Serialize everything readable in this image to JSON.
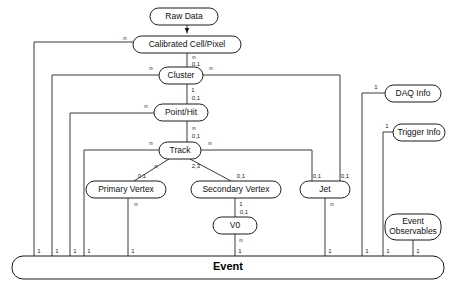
{
  "diagram": {
    "type": "entity-relationship-diagram",
    "colors": {
      "background": "#ffffff",
      "node_stroke": "#1a1a1a",
      "node_fill": "#ffffff",
      "edge_stroke": "#3a3a3a",
      "text": "#111111"
    },
    "nodes": [
      {
        "id": "raw_data",
        "label": "Raw Data",
        "x": 150,
        "y": 8,
        "w": 68,
        "h": 17,
        "lines": [
          "Raw Data"
        ]
      },
      {
        "id": "calibrated_cell",
        "label": "Calibrated Cell/Pixel",
        "x": 133,
        "y": 36,
        "w": 108,
        "h": 17,
        "lines": [
          "Calibrated Cell/Pixel"
        ]
      },
      {
        "id": "cluster",
        "label": "Cluster",
        "x": 159,
        "y": 67,
        "w": 44,
        "h": 17,
        "lines": [
          "Cluster"
        ]
      },
      {
        "id": "point_hit",
        "label": "Point/Hit",
        "x": 154,
        "y": 104,
        "w": 54,
        "h": 17,
        "lines": [
          "Point/Hit"
        ]
      },
      {
        "id": "track",
        "label": "Track",
        "x": 159,
        "y": 142,
        "w": 42,
        "h": 17,
        "lines": [
          "Track"
        ]
      },
      {
        "id": "primary_vertex",
        "label": "Primary Vertex",
        "x": 86,
        "y": 181,
        "w": 80,
        "h": 17,
        "lines": [
          "Primary Vertex"
        ]
      },
      {
        "id": "secondary_vertex",
        "label": "Secondary Vertex",
        "x": 191,
        "y": 181,
        "w": 90,
        "h": 17,
        "lines": [
          "Secondary Vertex"
        ]
      },
      {
        "id": "jet",
        "label": "Jet",
        "x": 300,
        "y": 181,
        "w": 50,
        "h": 17,
        "lines": [
          "Jet"
        ]
      },
      {
        "id": "v0",
        "label": "V0",
        "x": 213,
        "y": 217,
        "w": 44,
        "h": 17,
        "lines": [
          "V0"
        ]
      },
      {
        "id": "daq_info",
        "label": "DAQ Info",
        "x": 385,
        "y": 85,
        "w": 56,
        "h": 17,
        "lines": [
          "DAQ Info"
        ]
      },
      {
        "id": "trigger_info",
        "label": "Trigger Info",
        "x": 393,
        "y": 124,
        "w": 52,
        "h": 17,
        "lines": [
          "Trigger Info"
        ]
      },
      {
        "id": "event_observables",
        "label": "Event Observables",
        "x": 385,
        "y": 214,
        "w": 56,
        "h": 26,
        "lines": [
          "Event",
          "Observables"
        ]
      },
      {
        "id": "event",
        "label": "Event",
        "x": 12,
        "y": 256,
        "w": 432,
        "h": 23,
        "lines": [
          "Event"
        ]
      }
    ],
    "cardinalities": [
      {
        "id": "card-cal-n",
        "text": "n",
        "x": 125,
        "y": 38
      },
      {
        "id": "card-cal-down-n",
        "text": "n",
        "x": 194,
        "y": 57
      },
      {
        "id": "card-cluster-01",
        "text": "0,1",
        "x": 196,
        "y": 64
      },
      {
        "id": "card-cluster-left-n",
        "text": "n",
        "x": 151,
        "y": 68
      },
      {
        "id": "card-cluster-right-n",
        "text": "n",
        "x": 211,
        "y": 68
      },
      {
        "id": "card-cluster-down-1",
        "text": "1",
        "x": 193,
        "y": 90
      },
      {
        "id": "card-point-01",
        "text": "0,1",
        "x": 196,
        "y": 98
      },
      {
        "id": "card-point-left-n",
        "text": "n",
        "x": 146,
        "y": 106
      },
      {
        "id": "card-point-down-n",
        "text": "n",
        "x": 194,
        "y": 128
      },
      {
        "id": "card-track-01",
        "text": "0,1",
        "x": 196,
        "y": 136
      },
      {
        "id": "card-track-left-n",
        "text": "n",
        "x": 151,
        "y": 143
      },
      {
        "id": "card-track-right-n",
        "text": "n",
        "x": 210,
        "y": 143
      },
      {
        "id": "card-pv-n",
        "text": "n",
        "x": 156,
        "y": 166
      },
      {
        "id": "card-pv-01",
        "text": "0,1",
        "x": 142,
        "y": 176
      },
      {
        "id": "card-sv-23",
        "text": "2,3",
        "x": 196,
        "y": 166
      },
      {
        "id": "card-sv-01",
        "text": "0,1",
        "x": 241,
        "y": 176
      },
      {
        "id": "card-jet-01a",
        "text": "0,1",
        "x": 317,
        "y": 176
      },
      {
        "id": "card-jet-01b",
        "text": "0,1",
        "x": 345,
        "y": 176
      },
      {
        "id": "card-pv-down-n",
        "text": "n",
        "x": 136,
        "y": 204
      },
      {
        "id": "card-sv-down-1",
        "text": "1",
        "x": 241,
        "y": 204
      },
      {
        "id": "card-v0-01",
        "text": "0,1",
        "x": 244,
        "y": 212
      },
      {
        "id": "card-v0-down-n",
        "text": "n",
        "x": 241,
        "y": 240
      },
      {
        "id": "card-jet-down-n",
        "text": "n",
        "x": 332,
        "y": 204
      },
      {
        "id": "card-daq-1",
        "text": "1",
        "x": 376,
        "y": 87
      },
      {
        "id": "card-trigger-1",
        "text": "1",
        "x": 387,
        "y": 126
      },
      {
        "id": "card-ev-1a",
        "text": "1",
        "x": 39,
        "y": 251
      },
      {
        "id": "card-ev-1b",
        "text": "1",
        "x": 57,
        "y": 251
      },
      {
        "id": "card-ev-1c",
        "text": "1",
        "x": 75,
        "y": 251
      },
      {
        "id": "card-ev-1d",
        "text": "1",
        "x": 89,
        "y": 251
      },
      {
        "id": "card-ev-1e",
        "text": "1",
        "x": 133,
        "y": 251
      },
      {
        "id": "card-ev-1f",
        "text": "1",
        "x": 240,
        "y": 251
      },
      {
        "id": "card-ev-1g",
        "text": "1",
        "x": 330,
        "y": 251
      },
      {
        "id": "card-ev-1h",
        "text": "1",
        "x": 367,
        "y": 251
      },
      {
        "id": "card-ev-1i",
        "text": "1",
        "x": 388,
        "y": 251
      },
      {
        "id": "card-ev-1j",
        "text": "1",
        "x": 418,
        "y": 251
      }
    ],
    "edges": [
      {
        "id": "edge-raw-to-cal",
        "from": "raw_data",
        "to": "calibrated_cell",
        "path": "M 187 25 L 187 33"
      },
      {
        "id": "edge-cal-to-cluster",
        "from": "calibrated_cell",
        "to": "cluster",
        "path": "M 187 53 L 187 67"
      },
      {
        "id": "edge-cluster-to-point",
        "from": "cluster",
        "to": "point_hit",
        "path": "M 187 84 L 187 104"
      },
      {
        "id": "edge-point-to-track",
        "from": "point_hit",
        "to": "track",
        "path": "M 187 121 L 187 142"
      },
      {
        "id": "edge-track-to-pv",
        "from": "track",
        "to": "primary_vertex",
        "path": "M 169 159 L 134 181"
      },
      {
        "id": "edge-track-to-sv",
        "from": "track",
        "to": "secondary_vertex",
        "path": "M 190 159 L 231 181"
      },
      {
        "id": "edge-sv-to-v0",
        "from": "secondary_vertex",
        "to": "v0",
        "path": "M 235 198 L 235 217"
      },
      {
        "id": "edge-cal-left-event",
        "from": "calibrated_cell",
        "to": "event",
        "path": "M 133 42 L 34 42 L 34 256"
      },
      {
        "id": "edge-cluster-left-event",
        "from": "cluster",
        "to": "event",
        "path": "M 159 75 L 52 75 L 52 256"
      },
      {
        "id": "edge-point-left-event",
        "from": "point_hit",
        "to": "event",
        "path": "M 154 113 L 70 113 L 70 256"
      },
      {
        "id": "edge-track-left-event",
        "from": "track",
        "to": "event",
        "path": "M 159 150 L 84 150 L 84 256"
      },
      {
        "id": "edge-pv-event",
        "from": "primary_vertex",
        "to": "event",
        "path": "M 128 198 L 128 256"
      },
      {
        "id": "edge-v0-event",
        "from": "v0",
        "to": "event",
        "path": "M 235 234 L 235 256"
      },
      {
        "id": "edge-cluster-right-jet",
        "from": "cluster",
        "to": "jet",
        "path": "M 203 75 L 340 75 L 340 181"
      },
      {
        "id": "edge-track-right-jet",
        "from": "track",
        "to": "jet",
        "path": "M 201 150 L 312 150 L 312 181"
      },
      {
        "id": "edge-jet-event",
        "from": "jet",
        "to": "event",
        "path": "M 325 198 L 325 256"
      },
      {
        "id": "edge-daq-event",
        "from": "daq_info",
        "to": "event",
        "path": "M 385 93 L 362 93 L 362 256"
      },
      {
        "id": "edge-trigger-event",
        "from": "trigger_info",
        "to": "event",
        "path": "M 393 132 L 383 132 L 383 256"
      },
      {
        "id": "edge-observables-event",
        "from": "event_observables",
        "to": "event",
        "path": "M 413 240 L 413 256"
      }
    ]
  }
}
